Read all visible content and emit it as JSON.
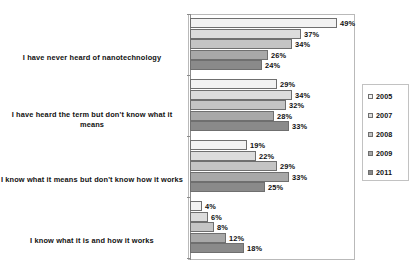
{
  "chart_data": {
    "type": "bar",
    "orientation": "horizontal",
    "title": "",
    "subtitle": "",
    "xlabel": "",
    "ylabel": "",
    "xlim": [
      0,
      55
    ],
    "grid": false,
    "legend_position": "right",
    "value_suffix": "%",
    "categories": [
      "I have never heard of nanotechnology",
      "I have heard the term but don't know what it means",
      "I know what it means but don't know how it works",
      "I know what it is and how it works"
    ],
    "series": [
      {
        "name": "2005",
        "color": "#f2f2f2",
        "values": [
          49,
          29,
          19,
          4
        ]
      },
      {
        "name": "2007",
        "color": "#dcdcdc",
        "values": [
          37,
          34,
          22,
          6
        ]
      },
      {
        "name": "2008",
        "color": "#c4c4c4",
        "values": [
          34,
          32,
          29,
          8
        ]
      },
      {
        "name": "2009",
        "color": "#a8a8a8",
        "values": [
          26,
          28,
          33,
          12
        ]
      },
      {
        "name": "2011",
        "color": "#8a8a8a",
        "values": [
          24,
          33,
          25,
          18
        ]
      }
    ],
    "data_labels": [
      [
        "49%",
        "37%",
        "34%",
        "26%",
        "24%"
      ],
      [
        "29%",
        "34%",
        "32%",
        "28%",
        "33%"
      ],
      [
        "19%",
        "22%",
        "29%",
        "33%",
        "25%"
      ],
      [
        "4%",
        "6%",
        "8%",
        "12%",
        "18%"
      ]
    ]
  },
  "legend": {
    "entries": [
      "2005",
      "2007",
      "2008",
      "2009",
      "2011"
    ]
  }
}
